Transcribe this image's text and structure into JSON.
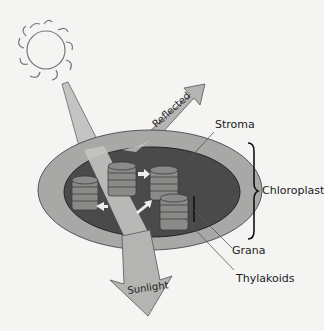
{
  "diagram": {
    "labels": {
      "reflected": "Reflected",
      "sunlight": "Sunlight",
      "stroma": "Stroma",
      "chloroplast": "Chloroplast",
      "grana": "Grana",
      "thylakoids": "Thylakoids"
    },
    "colors": {
      "background": "#f4f4f2",
      "outer_membrane": "#a8a8a6",
      "stroma_dark": "#4a4a4a",
      "grana_stack": "#8a8a88",
      "light_beam": "#c4c4c2",
      "arrow_fill": "#b4b4b2",
      "outline": "#333333"
    }
  }
}
